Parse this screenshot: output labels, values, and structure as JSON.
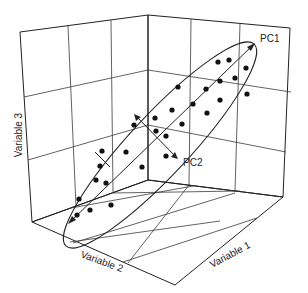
{
  "diagram": {
    "type": "3d-scatter-pca",
    "axes": {
      "x_label": "Variable 1",
      "y_label": "Variable 2",
      "z_label": "Variable 3"
    },
    "components": {
      "pc1_label": "PC1",
      "pc2_label": "PC2"
    },
    "colors": {
      "line": "#222222",
      "point": "#111111",
      "background": "#ffffff"
    },
    "points": [
      [
        192,
        61
      ],
      [
        203,
        59
      ],
      [
        247,
        68
      ],
      [
        215,
        74
      ],
      [
        200,
        82
      ],
      [
        224,
        79
      ],
      [
        178,
        88
      ],
      [
        206,
        87
      ],
      [
        183,
        100
      ],
      [
        193,
        94
      ],
      [
        167,
        108
      ],
      [
        157,
        113
      ],
      [
        203,
        110
      ],
      [
        176,
        116
      ],
      [
        147,
        117
      ],
      [
        135,
        127
      ],
      [
        155,
        122
      ],
      [
        155,
        131
      ],
      [
        132,
        145
      ],
      [
        107,
        152
      ],
      [
        102,
        166
      ],
      [
        119,
        163
      ],
      [
        108,
        182
      ],
      [
        109,
        170
      ],
      [
        96,
        188
      ],
      [
        98,
        200
      ],
      [
        138,
        185
      ],
      [
        109,
        204
      ],
      [
        82,
        220
      ],
      [
        90,
        213
      ],
      [
        93,
        215
      ],
      [
        110,
        208
      ]
    ]
  }
}
